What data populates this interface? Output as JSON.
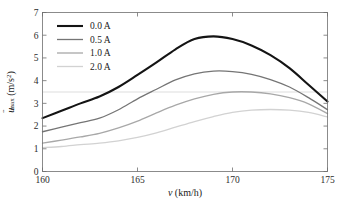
{
  "chart_data": {
    "type": "line",
    "title": "",
    "xlabel": "v (km/h)",
    "xlabel_var": "v",
    "xlabel_unit": "(km/h)",
    "ylabel": "ü_max (m/s^2)",
    "ylabel_var": "u",
    "ylabel_sub": "max",
    "ylabel_unit": "(m/s",
    "ylabel_unit_exp": "2",
    "ylabel_unit_close": ")",
    "xlim": [
      160,
      175
    ],
    "ylim": [
      0,
      7
    ],
    "xticks": [
      160,
      165,
      170,
      175
    ],
    "xtick_labels": [
      "160",
      "165",
      "170",
      "175"
    ],
    "yticks": [
      0,
      1,
      2,
      3,
      4,
      5,
      6,
      7
    ],
    "ytick_labels": [
      "0",
      "1",
      "2",
      "3",
      "4",
      "5",
      "6",
      "7"
    ],
    "grid": false,
    "gridlines_y": [
      3.5
    ],
    "legend_position": "upper-left",
    "legend_frame": false,
    "x": [
      160,
      161,
      162,
      163,
      164,
      165,
      166,
      167,
      168,
      169,
      170,
      171,
      172,
      173,
      174,
      175
    ],
    "series": [
      {
        "name": "0.0 A",
        "color": "#141414",
        "width": 2.1,
        "values": [
          2.35,
          2.67,
          3.0,
          3.3,
          3.72,
          4.25,
          4.8,
          5.38,
          5.83,
          5.95,
          5.83,
          5.55,
          5.12,
          4.55,
          3.82,
          3.08
        ]
      },
      {
        "name": "0.5 A",
        "color": "#757575",
        "width": 1.3,
        "values": [
          1.75,
          1.95,
          2.15,
          2.35,
          2.72,
          3.2,
          3.62,
          4.03,
          4.3,
          4.42,
          4.4,
          4.28,
          4.05,
          3.72,
          3.25,
          2.72
        ]
      },
      {
        "name": "1.0 A",
        "color": "#a8a8a8",
        "width": 1.3,
        "values": [
          1.25,
          1.38,
          1.52,
          1.68,
          1.92,
          2.22,
          2.58,
          2.92,
          3.2,
          3.4,
          3.5,
          3.5,
          3.42,
          3.25,
          2.98,
          2.55
        ]
      },
      {
        "name": "2.0 A",
        "color": "#d2d2d2",
        "width": 1.3,
        "values": [
          1.05,
          1.1,
          1.18,
          1.25,
          1.35,
          1.5,
          1.7,
          1.95,
          2.2,
          2.42,
          2.6,
          2.7,
          2.73,
          2.7,
          2.6,
          2.4
        ]
      }
    ]
  },
  "legend": {
    "items": [
      {
        "label": "0.0 A"
      },
      {
        "label": "0.5 A"
      },
      {
        "label": "1.0 A"
      },
      {
        "label": "2.0 A"
      }
    ]
  }
}
